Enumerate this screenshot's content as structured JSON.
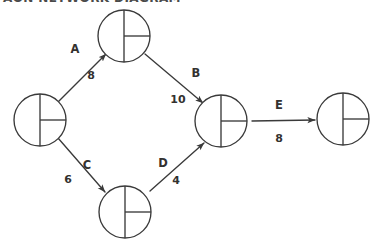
{
  "canvas": {
    "width": 384,
    "height": 251,
    "background": "#ffffff",
    "ink": "#3a3a3a",
    "text_color": "#33312f"
  },
  "caption": {
    "text": "AON NETWORK DIAGRAM",
    "clipped": true
  },
  "diagram": {
    "type": "activity-on-arrow-network",
    "node_glyph": "circle-with-vertical-diameter-and-right-radius",
    "nodes": [
      {
        "id": "n1",
        "name": "start-node",
        "cx": 40,
        "cy": 120,
        "r": 26
      },
      {
        "id": "n2",
        "name": "top-node",
        "cx": 124,
        "cy": 36,
        "r": 26
      },
      {
        "id": "n3",
        "name": "bottom-node",
        "cx": 125,
        "cy": 212,
        "r": 26
      },
      {
        "id": "n4",
        "name": "merge-node",
        "cx": 221,
        "cy": 121,
        "r": 26
      },
      {
        "id": "n5",
        "name": "end-node",
        "cx": 343,
        "cy": 119,
        "r": 26
      }
    ],
    "edges": [
      {
        "id": "e-a",
        "name": "edge-a",
        "label": "A",
        "duration": "8",
        "from": "n1",
        "to": "n2",
        "x1": 58,
        "y1": 102,
        "x2": 106,
        "y2": 54,
        "label_x": 75,
        "label_y": 49,
        "duration_x": 91,
        "duration_y": 76
      },
      {
        "id": "e-b",
        "name": "edge-b",
        "label": "B",
        "duration": "10",
        "from": "n2",
        "to": "n4",
        "x1": 145,
        "y1": 54,
        "x2": 203,
        "y2": 103,
        "label_x": 196,
        "label_y": 73,
        "duration_x": 178,
        "duration_y": 100
      },
      {
        "id": "e-c",
        "name": "edge-c",
        "label": "C",
        "duration": "6",
        "from": "n1",
        "to": "n3",
        "x1": 58,
        "y1": 138,
        "x2": 105,
        "y2": 192,
        "label_x": 87,
        "label_y": 165,
        "duration_x": 68,
        "duration_y": 180
      },
      {
        "id": "e-d",
        "name": "edge-d",
        "label": "D",
        "duration": "4",
        "from": "n3",
        "to": "n4",
        "x1": 150,
        "y1": 191,
        "x2": 204,
        "y2": 143,
        "label_x": 163,
        "label_y": 163,
        "duration_x": 176,
        "duration_y": 181
      },
      {
        "id": "e-e",
        "name": "edge-e",
        "label": "E",
        "duration": "8",
        "from": "n4",
        "to": "n5",
        "x1": 252,
        "y1": 121,
        "x2": 315,
        "y2": 120,
        "label_x": 279,
        "label_y": 105,
        "duration_x": 279,
        "duration_y": 139
      }
    ]
  }
}
